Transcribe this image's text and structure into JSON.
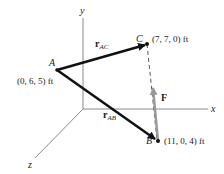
{
  "diagram": {
    "axes": {
      "x_label": "x",
      "y_label": "y",
      "z_label": "z"
    },
    "points": {
      "A": {
        "label": "A",
        "coords": "(0, 6, 5) ft"
      },
      "B": {
        "label": "B",
        "coords": "(11, 0, 4) ft"
      },
      "C": {
        "label": "C",
        "coords": "(7, 7, 0) ft"
      }
    },
    "vectors": {
      "rAC": {
        "main": "r",
        "sub": "AC"
      },
      "rAB": {
        "main": "r",
        "sub": "AB"
      },
      "F": {
        "label": "F"
      }
    },
    "colors": {
      "axis": "#8a8a8a",
      "position_vector": "#111111",
      "force_vector": "#9a9a9a",
      "dashed_line": "#555555"
    }
  }
}
